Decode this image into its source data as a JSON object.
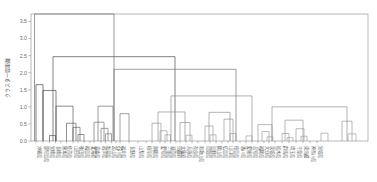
{
  "figure": {
    "type": "dendrogram",
    "background": "#ffffff",
    "frame_color": "#9a9a9a"
  },
  "axes": {
    "y_axis_title": "クラスター間距離",
    "y_ticks": [
      "0.0",
      "0.5",
      "1.0",
      "1.5",
      "2.0",
      "2.5",
      "3.0",
      "3.5"
    ],
    "y_tick_values": [
      0.0,
      0.5,
      1.0,
      1.5,
      2.0,
      2.5,
      3.0,
      3.5
    ],
    "ylim": [
      0.0,
      3.72
    ],
    "x_axis_title": "",
    "grid": false
  },
  "chart_data": {
    "type": "line",
    "title": "",
    "xlabel": "",
    "ylabel": "クラスター間距離",
    "ylim": [
      0.0,
      3.72
    ],
    "method": "hierarchical-clustering-dendrogram",
    "leaf_count": 47,
    "leaves": [
      "沖縄県",
      "鹿児島県",
      "宮崎県",
      "長崎県",
      "熊本県",
      "佐賀県",
      "山形県",
      "秋田県",
      "福島県",
      "北海道",
      "青森県",
      "岩手県",
      "新潟県",
      "富山県",
      "石川県",
      "福井県",
      "長野県",
      "山梨県",
      "岐阜県",
      "静岡県",
      "愛知県",
      "三重県",
      "滋賀県",
      "京都府",
      "大阪府",
      "兵庫県",
      "奈良県",
      "和歌山県",
      "鳥取県",
      "島根県",
      "岡山県",
      "広島県",
      "山口県",
      "徳島県",
      "香川県",
      "愛媛県",
      "高知県",
      "福岡県",
      "大分県",
      "茨城県",
      "栃木県",
      "群馬県",
      "埼玉県",
      "千葉県",
      "東京都",
      "神奈川県",
      "宮城県"
    ],
    "merges": [
      {
        "id": 1,
        "height": 1.65,
        "color": "#3a3a3a",
        "x_left": 36.0,
        "x_right": 43.0
      },
      {
        "id": 2,
        "height": 1.48,
        "color": "#3f3f3f",
        "x_left": 43.0,
        "x_right": 56.0
      },
      {
        "id": 3,
        "height": 0.16,
        "color": "#4a4a4a",
        "x_left": 49.5,
        "x_right": 55.5
      },
      {
        "id": 4,
        "height": 1.02,
        "color": "#4d4d4d",
        "x_left": 56.0,
        "x_right": 73.0
      },
      {
        "id": 5,
        "height": 0.52,
        "color": "#555555",
        "x_left": 66.5,
        "x_right": 76.0
      },
      {
        "id": 6,
        "height": 0.4,
        "color": "#5a5a5a",
        "x_left": 73.0,
        "x_right": 80.0
      },
      {
        "id": 7,
        "height": 0.19,
        "color": "#5e5e5e",
        "x_left": 78.0,
        "x_right": 84.0
      },
      {
        "id": 8,
        "height": 0.55,
        "color": "#6a6a6a",
        "x_left": 94.0,
        "x_right": 104.0
      },
      {
        "id": 9,
        "height": 0.37,
        "color": "#6d6d6d",
        "x_left": 101.0,
        "x_right": 108.0
      },
      {
        "id": 10,
        "height": 0.21,
        "color": "#707070",
        "x_left": 105.5,
        "x_right": 111.5
      },
      {
        "id": 11,
        "height": 1.02,
        "color": "#676767",
        "x_left": 98.0,
        "x_right": 113.0
      },
      {
        "id": 12,
        "height": 0.8,
        "color": "#6f6f6f",
        "x_left": 120.0,
        "x_right": 129.0
      },
      {
        "id": 13,
        "height": 2.47,
        "color": "#585858",
        "x_left": 53.0,
        "x_right": 175.0
      },
      {
        "id": 14,
        "height": 3.72,
        "color": "#777777",
        "x_left": 34.5,
        "x_right": 114.0
      },
      {
        "id": 15,
        "height": 0.52,
        "color": "#8f8f8f",
        "x_left": 152.0,
        "x_right": 161.0
      },
      {
        "id": 16,
        "height": 0.3,
        "color": "#949494",
        "x_left": 160.0,
        "x_right": 167.0
      },
      {
        "id": 17,
        "height": 0.18,
        "color": "#9a9a9a",
        "x_left": 165.0,
        "x_right": 170.5
      },
      {
        "id": 18,
        "height": 0.54,
        "color": "#8f8f8f",
        "x_left": 180.0,
        "x_right": 190.0
      },
      {
        "id": 19,
        "height": 0.17,
        "color": "#9a9a9a",
        "x_left": 186.0,
        "x_right": 192.0
      },
      {
        "id": 20,
        "height": 0.85,
        "color": "#8a8a8a",
        "x_left": 158.0,
        "x_right": 185.0
      },
      {
        "id": 21,
        "height": 0.44,
        "color": "#939393",
        "x_left": 205.0,
        "x_right": 213.0
      },
      {
        "id": 22,
        "height": 0.18,
        "color": "#9a9a9a",
        "x_left": 210.0,
        "x_right": 216.0
      },
      {
        "id": 23,
        "height": 0.64,
        "color": "#8f8f8f",
        "x_left": 224.0,
        "x_right": 233.0
      },
      {
        "id": 24,
        "height": 0.22,
        "color": "#9a9a9a",
        "x_left": 230.0,
        "x_right": 236.0
      },
      {
        "id": 25,
        "height": 0.84,
        "color": "#8a8a8a",
        "x_left": 209.0,
        "x_right": 230.0
      },
      {
        "id": 26,
        "height": 1.32,
        "color": "#858585",
        "x_left": 171.0,
        "x_right": 252.0
      },
      {
        "id": 27,
        "height": 0.15,
        "color": "#9a9a9a",
        "x_left": 246.0,
        "x_right": 252.0
      },
      {
        "id": 28,
        "height": 0.28,
        "color": "#969696",
        "x_left": 262.0,
        "x_right": 269.0
      },
      {
        "id": 29,
        "height": 0.12,
        "color": "#9e9e9e",
        "x_left": 267.0,
        "x_right": 273.0
      },
      {
        "id": 30,
        "height": 0.48,
        "color": "#919191",
        "x_left": 258.0,
        "x_right": 272.0
      },
      {
        "id": 31,
        "height": 0.22,
        "color": "#979797",
        "x_left": 282.0,
        "x_right": 289.0
      },
      {
        "id": 32,
        "height": 0.1,
        "color": "#9e9e9e",
        "x_left": 287.0,
        "x_right": 293.0
      },
      {
        "id": 33,
        "height": 0.36,
        "color": "#949494",
        "x_left": 296.0,
        "x_right": 304.0
      },
      {
        "id": 34,
        "height": 0.14,
        "color": "#9c9c9c",
        "x_left": 301.0,
        "x_right": 307.0
      },
      {
        "id": 35,
        "height": 0.61,
        "color": "#8e8e8e",
        "x_left": 285.0,
        "x_right": 303.0
      },
      {
        "id": 36,
        "height": 0.23,
        "color": "#999999",
        "x_left": 321.0,
        "x_right": 328.0
      },
      {
        "id": 37,
        "height": 0.58,
        "color": "#8f8f8f",
        "x_left": 342.0,
        "x_right": 352.0
      },
      {
        "id": 38,
        "height": 0.21,
        "color": "#9a9a9a",
        "x_left": 348.0,
        "x_right": 356.0
      },
      {
        "id": 39,
        "height": 1.0,
        "color": "#888888",
        "x_left": 272.0,
        "x_right": 347.0
      },
      {
        "id": 40,
        "height": 2.1,
        "color": "#7e7e7e",
        "x_left": 114.0,
        "x_right": 236.0
      }
    ],
    "leaf_positions": [
      36.0,
      43.0,
      49.5,
      55.5,
      61.0,
      66.5,
      73.0,
      78.0,
      84.0,
      90.0,
      94.0,
      101.0,
      105.5,
      111.5,
      116.0,
      120.0,
      129.0,
      138.0,
      146.0,
      152.0,
      160.0,
      165.0,
      170.5,
      176.0,
      180.0,
      186.0,
      192.0,
      198.0,
      205.0,
      210.0,
      216.0,
      222.0,
      228.0,
      233.0,
      240.0,
      246.0,
      252.0,
      258.0,
      264.0,
      269.0,
      275.0,
      282.0,
      289.0,
      296.0,
      303.0,
      310.0,
      317.0
    ]
  },
  "plot_geometry": {
    "left": 31,
    "right": 368,
    "top": 14,
    "bottom": 141,
    "note": "pixel frame of the axes box"
  }
}
